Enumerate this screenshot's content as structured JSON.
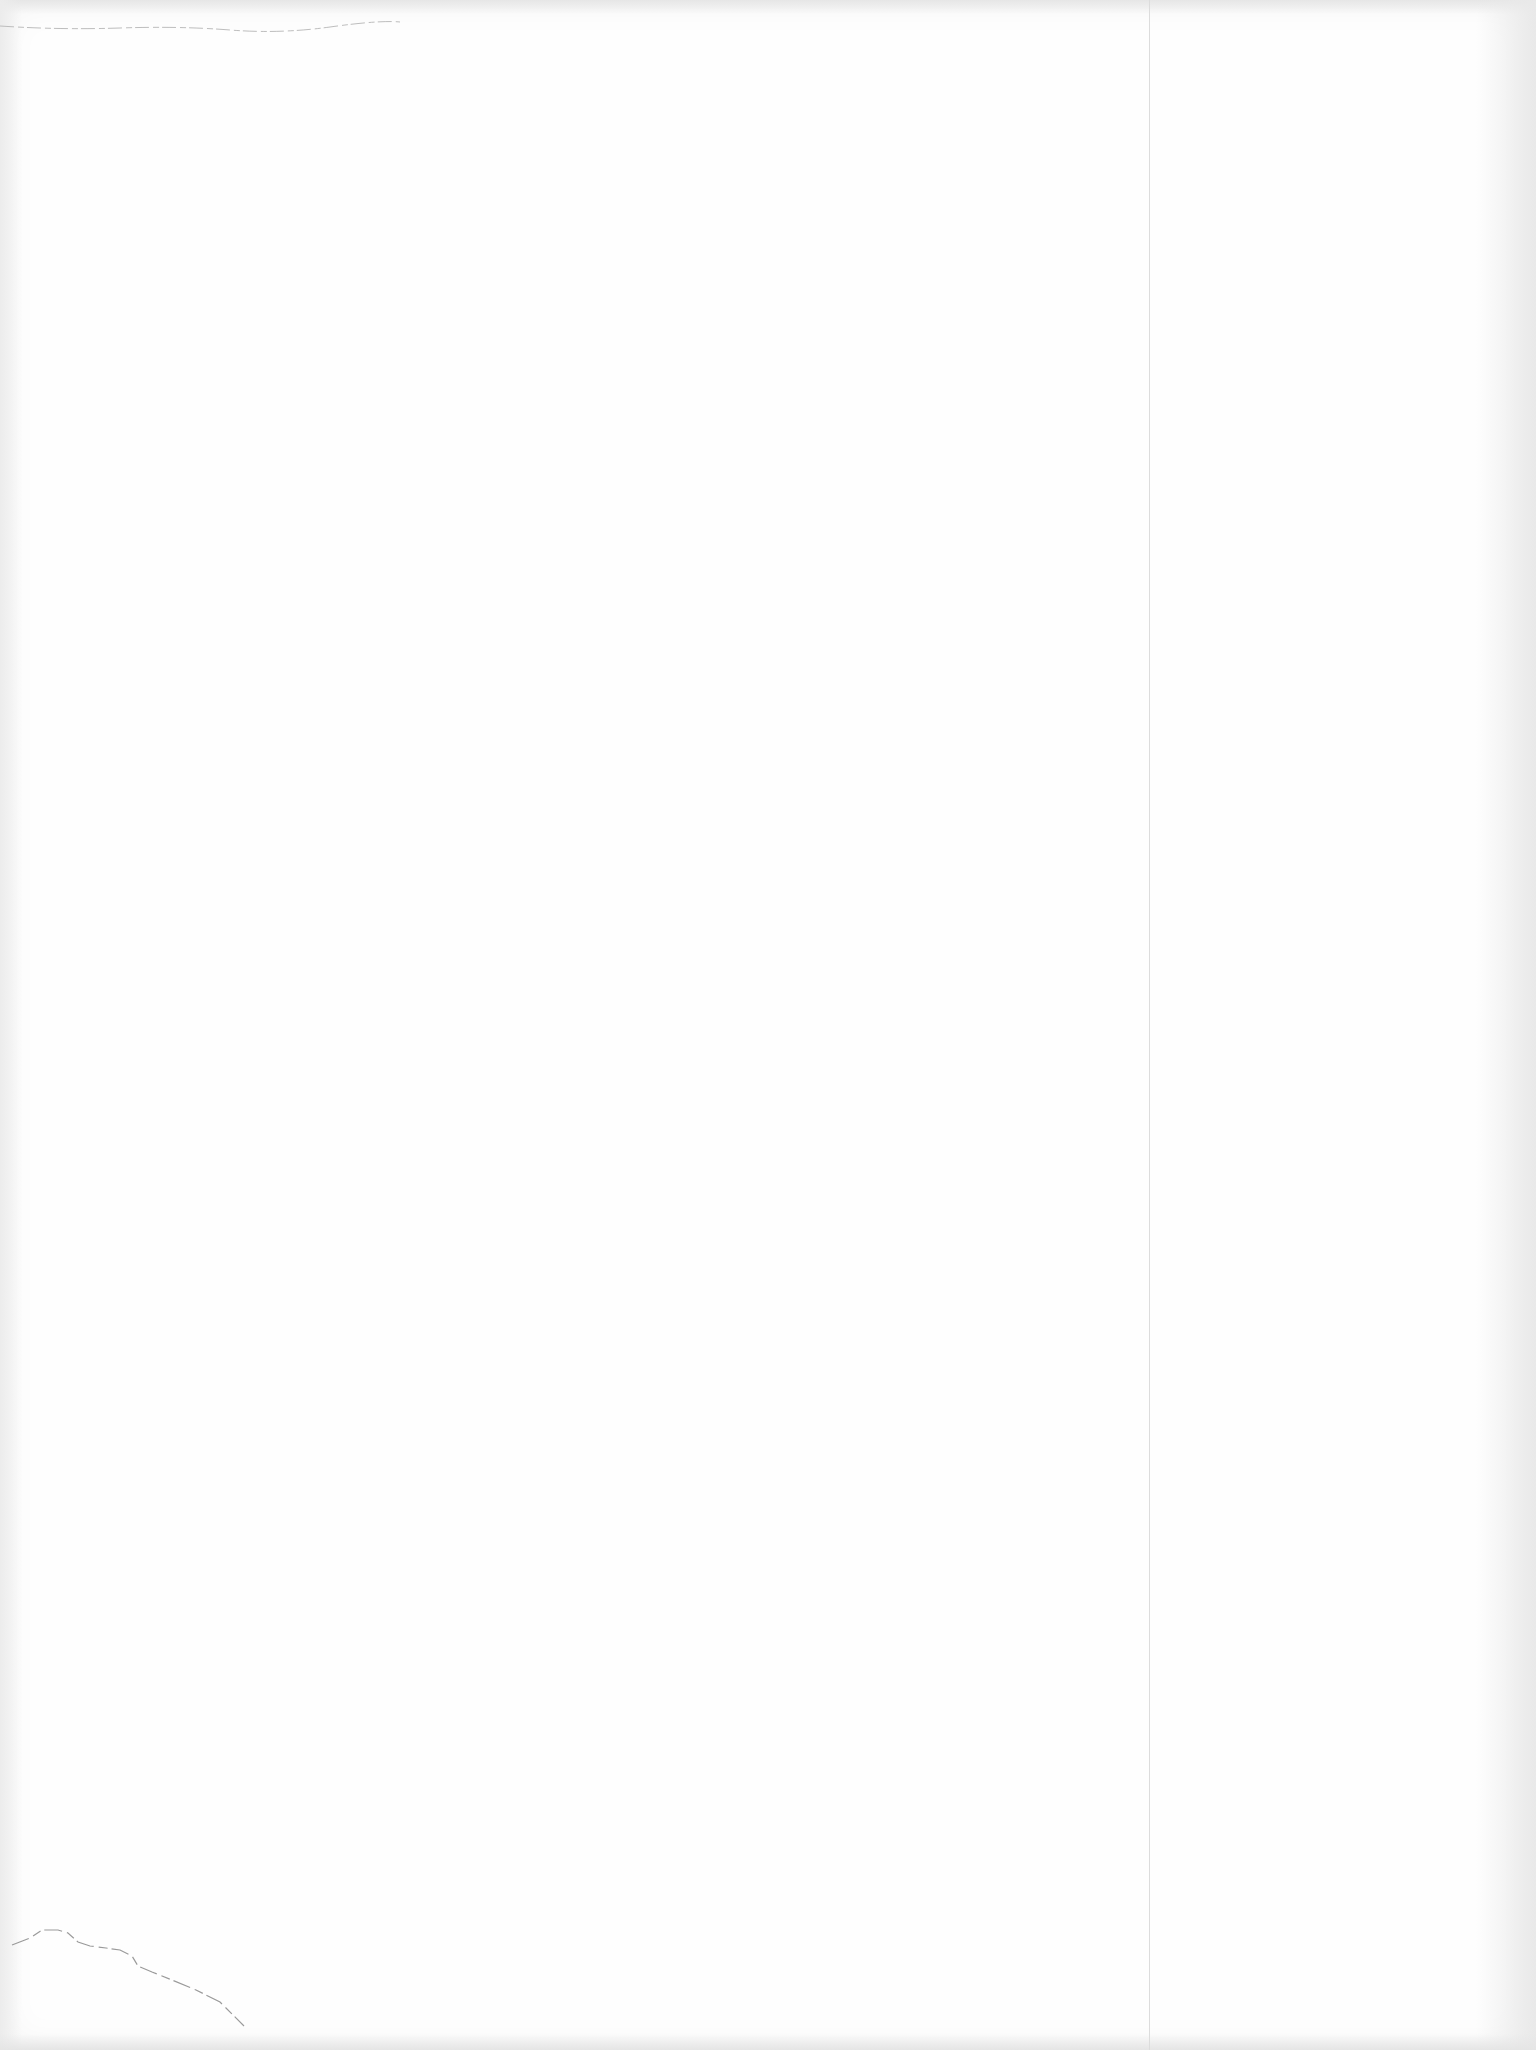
{
  "page": {
    "type": "blank-scanned-page",
    "text": "",
    "colors": {
      "paper": "#fefefe",
      "edge_shadow": "#e6e6e6",
      "fold_line": "#dcdcdc",
      "tear_mark": "#9a9a9a"
    }
  }
}
